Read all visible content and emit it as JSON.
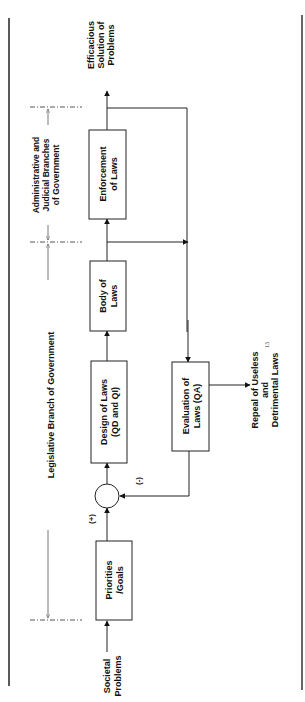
{
  "diagram": {
    "boxes": {
      "priorities": [
        "Priorities",
        "/Goals"
      ],
      "design": [
        "Design of Laws",
        "(QD and QI)"
      ],
      "body": [
        "Body of",
        "Laws"
      ],
      "enforcement": [
        "Enforcement",
        "of Laws"
      ],
      "evaluation": [
        "Evaluation of",
        "Laws (QA)"
      ]
    },
    "inputs": {
      "societal_problems": [
        "Societal",
        "Problems"
      ]
    },
    "outputs": {
      "efficacious_solution": [
        "Efficacious",
        "Solution of",
        "Problems"
      ],
      "repeal": [
        "Repeal of Useless",
        "and",
        "Detrimental Laws"
      ],
      "repeal_footnote": "13"
    },
    "signs": {
      "plus": "(+)",
      "minus": "(-)"
    },
    "branches": {
      "legislative": "Legislative Branch of Government",
      "administrative": [
        "Administrative and",
        "Judicial Branches",
        "of Government"
      ]
    }
  }
}
